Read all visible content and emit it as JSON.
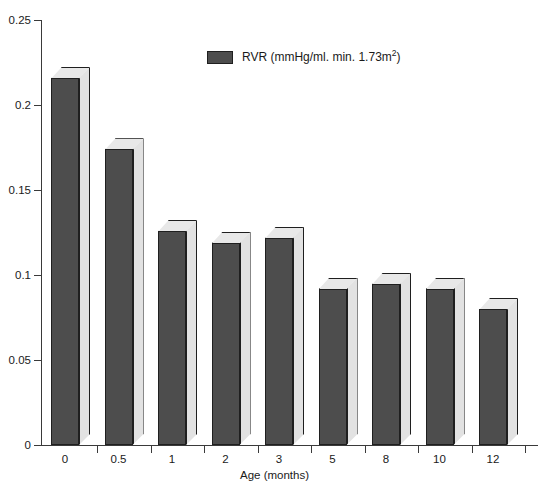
{
  "chart_data": {
    "type": "bar",
    "title": "",
    "subtitle": "",
    "xlabel": "Age (months)",
    "ylabel": "",
    "categories": [
      "0",
      "0.5",
      "1",
      "2",
      "3",
      "5",
      "8",
      "10",
      "12"
    ],
    "values": [
      0.216,
      0.174,
      0.126,
      0.119,
      0.122,
      0.092,
      0.095,
      0.092,
      0.08
    ],
    "series": [
      {
        "name": "RVR (mmHg/ml. min. 1.73m2)",
        "values": [
          0.216,
          0.174,
          0.126,
          0.119,
          0.122,
          0.092,
          0.095,
          0.092,
          0.08
        ]
      }
    ],
    "ylim": [
      0,
      0.25
    ],
    "y_ticks": [
      "0",
      "0.05",
      "0.1",
      "0.15",
      "0.2",
      "0.25"
    ],
    "y_tick_values": [
      0,
      0.05,
      0.1,
      0.15,
      0.2,
      0.25
    ],
    "grid": false,
    "legend_position": "top-center",
    "legend": [
      {
        "label_main": "RVR (mmHg/ml. min. 1.73m",
        "label_sup": "2",
        "label_tail": ")",
        "color": "#4d4d4d"
      }
    ],
    "style": "3d-bars",
    "colors": {
      "bar_front": "#4d4d4d",
      "bar_side": "#e2e2e2",
      "bar_top": "#e8e8e8",
      "bar_outline": "#1f1f1f",
      "axis": "#3a3a3a",
      "background": "#ffffff",
      "text": "#1a1a1a"
    }
  },
  "axes": {
    "x_axis_title": "Age (months)"
  }
}
